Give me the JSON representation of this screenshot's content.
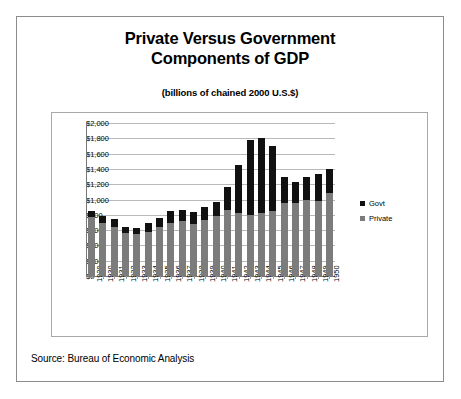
{
  "figure": {
    "title_lines": [
      "Private Versus Government",
      "Components of GDP"
    ],
    "subtitle": "(billions of chained 2000 U.S.$)",
    "source": "Source: Bureau of Economic Analysis"
  },
  "legend": {
    "position": "right",
    "entries": [
      {
        "label": "Govt",
        "color": "#111111"
      },
      {
        "label": "Private",
        "color": "#7c7c7c"
      }
    ]
  },
  "chart_data": {
    "type": "bar",
    "subtype": "stacked",
    "title": "Private Versus Government Components of GDP",
    "subtitle": "(billions of chained 2000 U.S.$)",
    "xlabel": "",
    "ylabel": "",
    "ylim": [
      0,
      2000
    ],
    "ytick_step": 200,
    "ytick_labels": [
      "$0",
      "$200",
      "$400",
      "$600",
      "$800",
      "$1,000",
      "$1,200",
      "$1,400",
      "$1,600",
      "$1,800",
      "$2,000"
    ],
    "ytick_values": [
      0,
      200,
      400,
      600,
      800,
      1000,
      1200,
      1400,
      1600,
      1800,
      2000
    ],
    "grid": true,
    "categories": [
      "1929",
      "1930",
      "1931",
      "1932",
      "1933",
      "1934",
      "1935",
      "1936",
      "1937",
      "1938",
      "1939",
      "1940",
      "1941",
      "1942",
      "1943",
      "1944",
      "1945",
      "1946",
      "1947",
      "1948",
      "1949",
      "1950"
    ],
    "series": [
      {
        "name": "Private",
        "color": "#7c7c7c",
        "values": [
          775,
          690,
          645,
          560,
          550,
          580,
          635,
          690,
          720,
          675,
          730,
          780,
          860,
          830,
          800,
          830,
          855,
          960,
          960,
          1000,
          985,
          1080
        ]
      },
      {
        "name": "Govt",
        "color": "#111111",
        "values": [
          75,
          90,
          95,
          80,
          80,
          110,
          120,
          155,
          145,
          165,
          175,
          190,
          300,
          620,
          975,
          975,
          850,
          330,
          265,
          290,
          345,
          325
        ]
      }
    ],
    "totals": [
      850,
      780,
      740,
      640,
      630,
      690,
      755,
      845,
      865,
      840,
      905,
      970,
      1160,
      1450,
      1775,
      1805,
      1705,
      1290,
      1225,
      1290,
      1330,
      1405
    ],
    "annotations": []
  }
}
